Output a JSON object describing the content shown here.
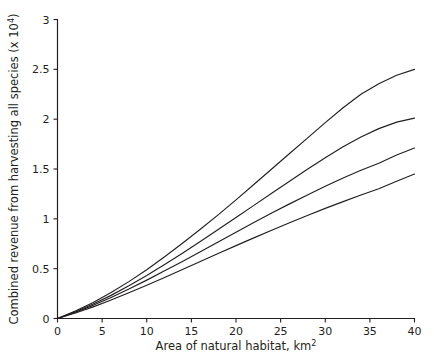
{
  "chart_data": {
    "type": "line",
    "title": "",
    "xlabel": "Area of natural habitat, km2",
    "xlabel_main": "Area of natural habitat, km",
    "xlabel_sup": "2",
    "ylabel": "Combined revenue from harvesting all species (x 104)",
    "ylabel_main": "Combined revenue from harvesting all species (x 10",
    "ylabel_sup": "4",
    "ylabel_tail": ")",
    "xlim": [
      0,
      40
    ],
    "ylim": [
      0,
      3
    ],
    "xticks": [
      0,
      5,
      10,
      15,
      20,
      25,
      30,
      35,
      40
    ],
    "xticklabels": [
      "0",
      "5",
      "10",
      "15",
      "20",
      "25",
      "30",
      "35",
      "40"
    ],
    "yticks": [
      0,
      0.5,
      1,
      1.5,
      2,
      2.5,
      3
    ],
    "yticklabels": [
      "0",
      "0.5",
      "1",
      "1.5",
      "2",
      "2.5",
      "3"
    ],
    "grid": false,
    "legend": "none",
    "line_color": "#231f20",
    "background_color": "#ffffff",
    "x": [
      0,
      2,
      4,
      6,
      8,
      10,
      12,
      14,
      16,
      18,
      20,
      22,
      24,
      26,
      28,
      30,
      32,
      34,
      36,
      38,
      40
    ],
    "series": [
      {
        "name": "curve-1",
        "values": [
          0,
          0.075,
          0.16,
          0.26,
          0.37,
          0.49,
          0.62,
          0.755,
          0.895,
          1.04,
          1.19,
          1.345,
          1.5,
          1.655,
          1.81,
          1.965,
          2.115,
          2.25,
          2.355,
          2.44,
          2.5
        ]
      },
      {
        "name": "curve-2",
        "values": [
          0,
          0.068,
          0.145,
          0.232,
          0.328,
          0.432,
          0.542,
          0.655,
          0.772,
          0.892,
          1.013,
          1.135,
          1.257,
          1.378,
          1.497,
          1.613,
          1.723,
          1.822,
          1.905,
          1.97,
          2.01
        ]
      },
      {
        "name": "curve-3",
        "values": [
          0,
          0.062,
          0.132,
          0.21,
          0.295,
          0.385,
          0.478,
          0.573,
          0.67,
          0.768,
          0.866,
          0.963,
          1.058,
          1.15,
          1.24,
          1.327,
          1.41,
          1.487,
          1.557,
          1.64,
          1.71
        ]
      },
      {
        "name": "curve-4",
        "values": [
          0,
          0.055,
          0.117,
          0.185,
          0.258,
          0.334,
          0.412,
          0.492,
          0.572,
          0.652,
          0.731,
          0.809,
          0.886,
          0.961,
          1.034,
          1.105,
          1.173,
          1.239,
          1.302,
          1.378,
          1.45
        ]
      }
    ]
  },
  "figure": {
    "name": "line-chart-revenue-vs-habitat"
  }
}
